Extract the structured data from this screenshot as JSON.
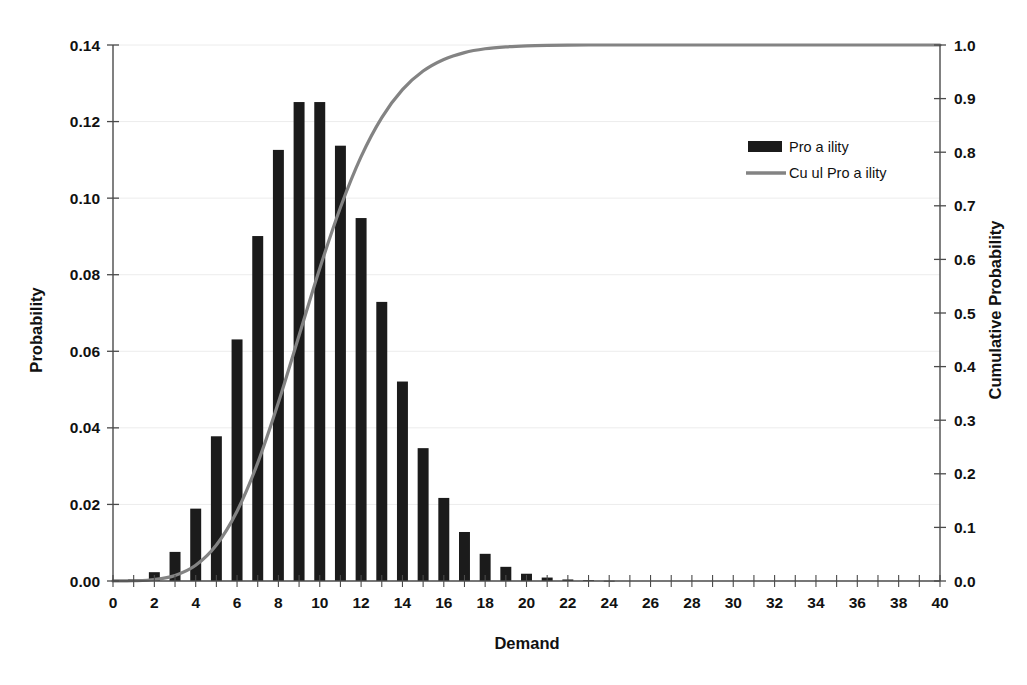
{
  "chart_data": {
    "type": "bar",
    "title": "",
    "xlabel": "Demand",
    "ylabel": "Probability",
    "y2label": "Cumulative Probability",
    "grid": true,
    "legend_position": "top-right",
    "xlim": [
      0,
      40
    ],
    "ylim": [
      0.0,
      0.14
    ],
    "y2lim": [
      0.0,
      1.0
    ],
    "x_tick_step": 2,
    "x_minor_tick_step": 1,
    "categories": [
      0,
      1,
      2,
      3,
      4,
      5,
      6,
      7,
      8,
      9,
      10,
      11,
      12,
      13,
      14,
      15,
      16,
      17,
      18,
      19,
      20,
      21,
      22,
      23,
      24,
      25,
      26,
      27,
      28,
      29,
      30,
      31,
      32,
      33,
      34,
      35,
      36,
      37,
      38,
      39,
      40
    ],
    "xticklabels": [
      "0",
      "2",
      "4",
      "6",
      "8",
      "10",
      "12",
      "14",
      "16",
      "18",
      "20",
      "22",
      "24",
      "26",
      "28",
      "30",
      "32",
      "34",
      "36",
      "38",
      "40"
    ],
    "yticklabels": [
      "0.00",
      "0.02",
      "0.04",
      "0.06",
      "0.08",
      "0.10",
      "0.12",
      "0.14"
    ],
    "y2ticklabels": [
      "0.0",
      "0.1",
      "0.2",
      "0.3",
      "0.4",
      "0.5",
      "0.6",
      "0.7",
      "0.8",
      "0.9",
      "1.0"
    ],
    "series": [
      {
        "name": "Pro  a  ility",
        "kind": "bar",
        "axis": "left",
        "color": "#1b1b1b",
        "values": [
          5e-05,
          0.0005,
          0.0023,
          0.0076,
          0.0189,
          0.0378,
          0.0631,
          0.0901,
          0.1126,
          0.1251,
          0.1251,
          0.1137,
          0.0948,
          0.0729,
          0.0521,
          0.0347,
          0.0217,
          0.0128,
          0.0071,
          0.0037,
          0.0019,
          0.0009,
          0.0004,
          0.0002,
          7e-05,
          3e-05,
          1e-05,
          4e-06,
          2e-06,
          5e-07,
          2e-07,
          0.0,
          0.0,
          0.0,
          0.0,
          0.0,
          0.0,
          0.0,
          0.0,
          0.0,
          0.0
        ]
      },
      {
        "name": "Cu   ul  Pro  a  ility",
        "kind": "line",
        "axis": "right",
        "color": "#838383",
        "values": [
          5e-05,
          0.00055,
          0.00285,
          0.01045,
          0.02935,
          0.06715,
          0.13025,
          0.22035,
          0.33295,
          0.45805,
          0.58315,
          0.69685,
          0.79165,
          0.86455,
          0.91665,
          0.95135,
          0.97305,
          0.98585,
          0.99295,
          0.99665,
          0.99855,
          0.99945,
          0.99985,
          1.0,
          1.0,
          1.0,
          1.0,
          1.0,
          1.0,
          1.0,
          1.0,
          1.0,
          1.0,
          1.0,
          1.0,
          1.0,
          1.0,
          1.0,
          1.0,
          1.0,
          1.0
        ]
      }
    ]
  },
  "legend": {
    "items": [
      {
        "label": "Pro  a  ility",
        "swatch": "bar",
        "color": "#1b1b1b"
      },
      {
        "label": "Cu   ul  Pro  a  ility",
        "swatch": "line",
        "color": "#838383"
      }
    ]
  },
  "axes": {
    "left_title": "Probability",
    "right_title": "Cumulative Probability",
    "bottom_title": "Demand"
  }
}
